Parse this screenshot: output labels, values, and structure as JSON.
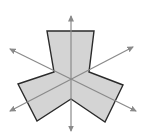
{
  "diagram": {
    "title": "Shape with three-fold rotational symmetry and three symmetry axes",
    "shape": {
      "fill": "#d4d4d4",
      "stroke": "#2a2a2a",
      "points": "47,31 94,31 89,72 123,85 105,122 71,99 37,121 18,84 54,72"
    },
    "axes": {
      "color": "#8a8a8a",
      "lines": [
        {
          "name": "vertical-axis",
          "x1": 71,
          "y1": 131,
          "x2": 71,
          "y2": 16
        },
        {
          "name": "diagonal-axis-rising",
          "x1": 10,
          "y1": 111,
          "x2": 133,
          "y2": 47
        },
        {
          "name": "diagonal-axis-falling",
          "x1": 10,
          "y1": 49,
          "x2": 136,
          "y2": 111
        }
      ]
    }
  }
}
